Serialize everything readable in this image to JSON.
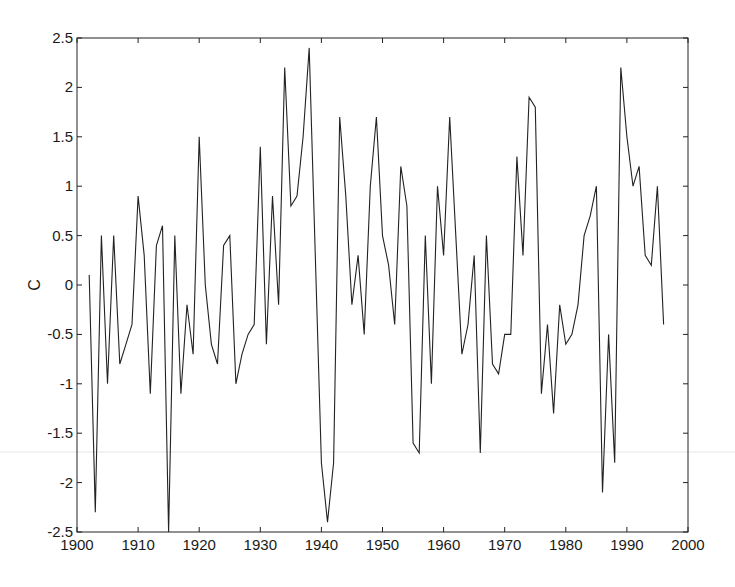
{
  "chart_data": {
    "type": "line",
    "title": "",
    "xlabel": "",
    "ylabel": "C",
    "xlim": [
      1900,
      2000
    ],
    "ylim": [
      -2.5,
      2.5
    ],
    "grid": false,
    "legend": null,
    "x_ticks": [
      1900,
      1910,
      1920,
      1930,
      1940,
      1950,
      1960,
      1970,
      1980,
      1990,
      2000
    ],
    "x_tick_labels": [
      "1900",
      "1910",
      "1920",
      "1930",
      "1940",
      "1950",
      "1960",
      "1970",
      "1980",
      "1990",
      "2000"
    ],
    "y_ticks": [
      -2.5,
      -2,
      -1.5,
      -1,
      -0.5,
      0,
      0.5,
      1,
      1.5,
      2,
      2.5
    ],
    "y_tick_labels": [
      "-2.5",
      "-2",
      "-1.5",
      "-1",
      "-0.5",
      "0",
      "0.5",
      "1",
      "1.5",
      "2",
      "2.5"
    ],
    "series": [
      {
        "name": "C",
        "color": "#222222",
        "x": [
          1902,
          1903,
          1904,
          1905,
          1906,
          1907,
          1908,
          1909,
          1910,
          1911,
          1912,
          1913,
          1914,
          1915,
          1916,
          1917,
          1918,
          1919,
          1920,
          1921,
          1922,
          1923,
          1924,
          1925,
          1926,
          1927,
          1928,
          1929,
          1930,
          1931,
          1932,
          1933,
          1934,
          1935,
          1936,
          1937,
          1938,
          1939,
          1940,
          1941,
          1942,
          1943,
          1944,
          1945,
          1946,
          1947,
          1948,
          1949,
          1950,
          1951,
          1952,
          1953,
          1954,
          1955,
          1956,
          1957,
          1958,
          1959,
          1960,
          1961,
          1962,
          1963,
          1964,
          1965,
          1966,
          1967,
          1968,
          1969,
          1970,
          1971,
          1972,
          1973,
          1974,
          1975,
          1976,
          1977,
          1978,
          1979,
          1980,
          1981,
          1982,
          1983,
          1984,
          1985,
          1986,
          1987,
          1988,
          1989,
          1990,
          1991,
          1992,
          1993,
          1994,
          1995,
          1996
        ],
        "values": [
          0.1,
          -2.3,
          0.5,
          -1.0,
          0.5,
          -0.8,
          -0.6,
          -0.4,
          0.9,
          0.3,
          -1.1,
          0.4,
          0.6,
          -2.5,
          0.5,
          -1.1,
          -0.2,
          -0.7,
          1.5,
          0.0,
          -0.6,
          -0.8,
          0.4,
          0.5,
          -1.0,
          -0.7,
          -0.5,
          -0.4,
          1.4,
          -0.6,
          0.9,
          -0.2,
          2.2,
          0.8,
          0.9,
          1.5,
          2.4,
          0.3,
          -1.8,
          -2.4,
          -1.8,
          1.7,
          0.9,
          -0.2,
          0.3,
          -0.5,
          1.0,
          1.7,
          0.5,
          0.2,
          -0.4,
          1.2,
          0.8,
          -1.6,
          -1.7,
          0.5,
          -1.0,
          1.0,
          0.3,
          1.7,
          0.5,
          -0.7,
          -0.4,
          0.3,
          -1.7,
          0.5,
          -0.8,
          -0.9,
          -0.5,
          -0.5,
          1.3,
          0.3,
          1.9,
          1.8,
          -1.1,
          -0.4,
          -1.3,
          -0.2,
          -0.6,
          -0.5,
          -0.2,
          0.5,
          0.7,
          1.0,
          -2.1,
          -0.5,
          -1.8,
          2.2,
          1.5,
          1.0,
          1.2,
          0.3,
          0.2,
          1.0,
          -0.4
        ]
      }
    ]
  },
  "plot": {
    "left": 77,
    "top": 38,
    "right": 688,
    "bottom": 532
  }
}
